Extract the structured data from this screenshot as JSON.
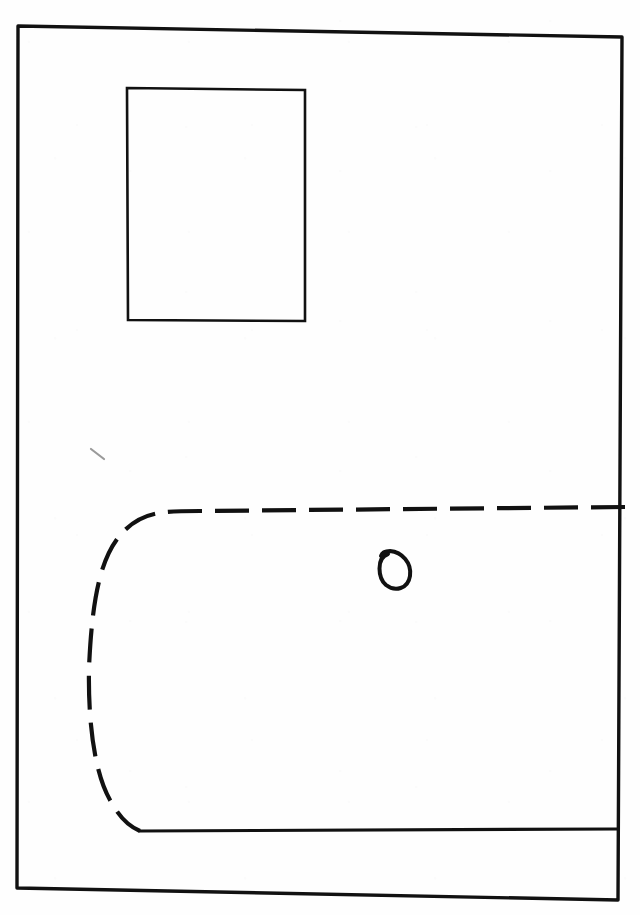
{
  "page": {
    "width": 640,
    "height": 915,
    "background_color": "#fefefe",
    "ink_color": "#111111",
    "faint_ink_color": "#9a9a9a",
    "media": "pen on paper, scanned"
  },
  "drawing": {
    "description": "Hand-drawn plan sketch: a large outer rectangular frame containing a small solid rectangle in the upper-left area, a long dashed line that turns a rounded corner on the left and runs down and back to the right, a solid horizontal line near the bottom, a small hand-drawn circle in the middle-right, and a faint short tick mark at the left.",
    "elements": [
      {
        "id": "outer-frame",
        "name": "outer-frame",
        "type": "rectangle",
        "stroke": "solid",
        "stroke_width": 3.4,
        "color": "#111111",
        "corners": [
          {
            "x": 18,
            "y": 26
          },
          {
            "x": 622,
            "y": 37
          },
          {
            "x": 618,
            "y": 900
          },
          {
            "x": 17,
            "y": 888
          }
        ],
        "note": "slightly skewed / hand-drawn, top edge slopes down to the right"
      },
      {
        "id": "inner-rectangle",
        "name": "inner-rectangle",
        "type": "rectangle",
        "stroke": "solid",
        "stroke_width": 2.6,
        "color": "#111111",
        "corners": [
          {
            "x": 127,
            "y": 88
          },
          {
            "x": 305,
            "y": 90
          },
          {
            "x": 305,
            "y": 321
          },
          {
            "x": 128,
            "y": 320
          }
        ],
        "note": "empty box in the upper-left region"
      },
      {
        "id": "dashed-path",
        "name": "dashed-path",
        "type": "path",
        "stroke": "dashed",
        "dash_length": 34,
        "dash_gap": 13,
        "stroke_width": 4.2,
        "color": "#111111",
        "path": "M 625 507 L 200 511 C 160 511 142 512 122 533 C 100 557 92 600 89 668 C 88 720 94 772 110 800 C 120 818 128 826 140 831",
        "note": "long dashed line: horizontal at top running to the right edge, rounded corner on the left, descending vertical run, rounded corner at the bottom"
      },
      {
        "id": "solid-bottom-line",
        "name": "solid-bottom-line",
        "type": "line",
        "stroke": "solid",
        "stroke_width": 3.2,
        "color": "#111111",
        "from": {
          "x": 140,
          "y": 831
        },
        "to": {
          "x": 617,
          "y": 829
        },
        "note": "runs from the end of the dashed curve to the right frame edge"
      },
      {
        "id": "small-circle",
        "name": "small-circle",
        "type": "circle",
        "stroke": "solid",
        "stroke_width": 4.0,
        "color": "#111111",
        "center": {
          "x": 394,
          "y": 568
        },
        "radius_x": 16,
        "radius_y": 17,
        "note": "hand-drawn circle with the pen stroke overshooting at the upper-left"
      },
      {
        "id": "faint-tick-mark",
        "name": "faint-tick-mark",
        "type": "line",
        "stroke": "solid",
        "stroke_width": 2.2,
        "color": "#9a9a9a",
        "from": {
          "x": 91,
          "y": 449
        },
        "to": {
          "x": 104,
          "y": 459
        },
        "note": "very light short diagonal pencil mark"
      }
    ]
  }
}
